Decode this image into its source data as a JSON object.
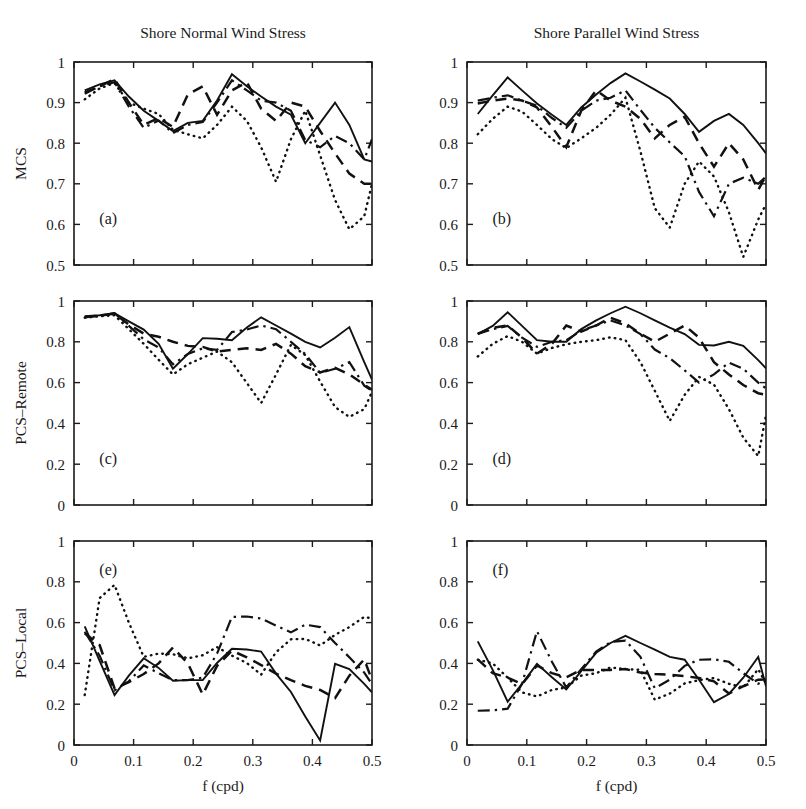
{
  "figure": {
    "width": 806,
    "height": 809,
    "background": "#ffffff",
    "ink_color": "#111111",
    "column_titles": [
      "Shore Normal Wind Stress",
      "Shore Parallel Wind Stress"
    ],
    "xlabel": "f (cpd)",
    "panel_tags": [
      "(a)",
      "(b)",
      "(c)",
      "(d)",
      "(e)",
      "(f)"
    ]
  },
  "axes": {
    "x": {
      "label": "f (cpd)",
      "lim": [
        0.0,
        0.5
      ],
      "ticks": [
        0.0,
        0.1,
        0.2,
        0.3,
        0.4,
        0.5
      ],
      "ticklabels": [
        "0",
        "0.1",
        "0.2",
        "0.3",
        "0.4",
        "0.5"
      ]
    },
    "y_top": {
      "label": "MCS",
      "lim": [
        0.5,
        1.0
      ],
      "ticks": [
        0.5,
        0.6,
        0.7,
        0.8,
        0.9,
        1.0
      ],
      "ticklabels": [
        "0.5",
        "0.6",
        "0.7",
        "0.8",
        "0.9",
        "1"
      ]
    },
    "y_mid": {
      "label": "PCS–Remote",
      "lim": [
        0.0,
        1.0
      ],
      "ticks": [
        0.0,
        0.2,
        0.4,
        0.6,
        0.8,
        1.0
      ],
      "ticklabels": [
        "0",
        "0.2",
        "0.4",
        "0.6",
        "0.8",
        "1"
      ]
    },
    "y_bot": {
      "label": "PCS–Local",
      "lim": [
        0.0,
        1.0
      ],
      "ticks": [
        0.0,
        0.2,
        0.4,
        0.6,
        0.8,
        1.0
      ],
      "ticklabels": [
        "0",
        "0.2",
        "0.4",
        "0.6",
        "0.8",
        "1"
      ]
    }
  },
  "linestyles": [
    "solid",
    "dashed",
    "dashdot",
    "dotted"
  ],
  "chart_data": [
    {
      "id": "panel-a",
      "tag": "(a)",
      "type": "line",
      "title": "Shore Normal Wind Stress",
      "xlabel": "f (cpd)",
      "ylabel": "MCS",
      "xlim": [
        0.0,
        0.5
      ],
      "ylim": [
        0.5,
        1.0
      ],
      "grid": false,
      "legend": "none",
      "x": [
        0.018,
        0.043,
        0.068,
        0.092,
        0.117,
        0.142,
        0.166,
        0.191,
        0.216,
        0.24,
        0.265,
        0.29,
        0.314,
        0.339,
        0.364,
        0.388,
        0.413,
        0.438,
        0.462,
        0.487,
        0.5
      ],
      "series": [
        {
          "name": "series-1",
          "linestyle": "solid",
          "values": [
            0.93,
            0.945,
            0.955,
            0.915,
            0.88,
            0.855,
            0.83,
            0.85,
            0.855,
            0.905,
            0.97,
            0.94,
            0.915,
            0.89,
            0.87,
            0.8,
            0.85,
            0.9,
            0.845,
            0.76,
            0.755
          ]
        },
        {
          "name": "series-2",
          "linestyle": "dashed",
          "values": [
            0.925,
            0.94,
            0.958,
            0.9,
            0.845,
            0.862,
            0.84,
            0.92,
            0.94,
            0.87,
            0.93,
            0.95,
            0.885,
            0.855,
            0.9,
            0.89,
            0.83,
            0.775,
            0.725,
            0.7,
            0.7
          ]
        },
        {
          "name": "series-3",
          "linestyle": "dashdot",
          "values": [
            0.922,
            0.94,
            0.95,
            0.89,
            0.838,
            0.856,
            0.825,
            0.845,
            0.852,
            0.9,
            0.955,
            0.93,
            0.905,
            0.9,
            0.88,
            0.808,
            0.79,
            0.818,
            0.8,
            0.76,
            0.81
          ]
        },
        {
          "name": "series-4",
          "linestyle": "dotted",
          "values": [
            0.908,
            0.935,
            0.948,
            0.9,
            0.885,
            0.872,
            0.833,
            0.822,
            0.812,
            0.845,
            0.89,
            0.855,
            0.79,
            0.705,
            0.81,
            0.88,
            0.77,
            0.66,
            0.588,
            0.62,
            0.7
          ]
        }
      ]
    },
    {
      "id": "panel-b",
      "tag": "(b)",
      "type": "line",
      "title": "Shore Parallel Wind Stress",
      "xlabel": "f (cpd)",
      "ylabel": "MCS",
      "xlim": [
        0.0,
        0.5
      ],
      "ylim": [
        0.5,
        1.0
      ],
      "grid": false,
      "legend": "none",
      "x": [
        0.018,
        0.043,
        0.068,
        0.092,
        0.117,
        0.142,
        0.166,
        0.191,
        0.216,
        0.24,
        0.265,
        0.29,
        0.314,
        0.339,
        0.364,
        0.388,
        0.413,
        0.438,
        0.462,
        0.487,
        0.5
      ],
      "series": [
        {
          "name": "series-1",
          "linestyle": "solid",
          "values": [
            0.872,
            0.918,
            0.962,
            0.93,
            0.898,
            0.87,
            0.845,
            0.888,
            0.92,
            0.948,
            0.972,
            0.952,
            0.932,
            0.91,
            0.872,
            0.828,
            0.855,
            0.872,
            0.845,
            0.8,
            0.775
          ]
        },
        {
          "name": "series-2",
          "linestyle": "dashed",
          "values": [
            0.898,
            0.905,
            0.91,
            0.905,
            0.888,
            0.84,
            0.79,
            0.88,
            0.93,
            0.905,
            0.89,
            0.86,
            0.812,
            0.845,
            0.865,
            0.8,
            0.742,
            0.8,
            0.76,
            0.685,
            0.72
          ]
        },
        {
          "name": "series-3",
          "linestyle": "dashdot",
          "values": [
            0.905,
            0.912,
            0.918,
            0.905,
            0.892,
            0.862,
            0.838,
            0.88,
            0.905,
            0.912,
            0.93,
            0.882,
            0.838,
            0.802,
            0.768,
            0.68,
            0.62,
            0.7,
            0.715,
            0.7,
            0.718
          ]
        },
        {
          "name": "series-4",
          "linestyle": "dotted",
          "values": [
            0.822,
            0.86,
            0.89,
            0.878,
            0.845,
            0.81,
            0.788,
            0.812,
            0.838,
            0.87,
            0.912,
            0.78,
            0.64,
            0.592,
            0.7,
            0.755,
            0.718,
            0.63,
            0.52,
            0.612,
            0.65
          ]
        }
      ]
    },
    {
      "id": "panel-c",
      "tag": "(c)",
      "type": "line",
      "title": "",
      "xlabel": "f (cpd)",
      "ylabel": "PCS–Remote",
      "xlim": [
        0.0,
        0.5
      ],
      "ylim": [
        0.0,
        1.0
      ],
      "grid": false,
      "legend": "none",
      "x": [
        0.018,
        0.043,
        0.068,
        0.092,
        0.117,
        0.142,
        0.166,
        0.191,
        0.216,
        0.24,
        0.265,
        0.29,
        0.314,
        0.339,
        0.364,
        0.388,
        0.413,
        0.438,
        0.462,
        0.487,
        0.5
      ],
      "series": [
        {
          "name": "series-1",
          "linestyle": "solid",
          "values": [
            0.925,
            0.93,
            0.94,
            0.9,
            0.86,
            0.79,
            0.668,
            0.74,
            0.818,
            0.815,
            0.808,
            0.87,
            0.92,
            0.88,
            0.84,
            0.8,
            0.772,
            0.82,
            0.872,
            0.7,
            0.615
          ]
        },
        {
          "name": "series-2",
          "linestyle": "dashed",
          "values": [
            0.922,
            0.928,
            0.938,
            0.885,
            0.84,
            0.825,
            0.8,
            0.78,
            0.775,
            0.752,
            0.76,
            0.768,
            0.76,
            0.79,
            0.742,
            0.68,
            0.65,
            0.672,
            0.64,
            0.59,
            0.565
          ]
        },
        {
          "name": "series-3",
          "linestyle": "dashdot",
          "values": [
            0.92,
            0.928,
            0.94,
            0.878,
            0.812,
            0.772,
            0.69,
            0.74,
            0.768,
            0.76,
            0.848,
            0.86,
            0.88,
            0.862,
            0.8,
            0.74,
            0.648,
            0.668,
            0.7,
            0.585,
            0.56
          ]
        },
        {
          "name": "series-4",
          "linestyle": "dotted",
          "values": [
            0.918,
            0.925,
            0.93,
            0.862,
            0.79,
            0.712,
            0.64,
            0.69,
            0.722,
            0.752,
            0.7,
            0.598,
            0.5,
            0.64,
            0.785,
            0.735,
            0.605,
            0.48,
            0.432,
            0.47,
            0.555
          ]
        }
      ]
    },
    {
      "id": "panel-d",
      "tag": "(d)",
      "type": "line",
      "title": "",
      "xlabel": "f (cpd)",
      "ylabel": "PCS–Remote",
      "xlim": [
        0.0,
        0.5
      ],
      "ylim": [
        0.0,
        1.0
      ],
      "grid": false,
      "legend": "none",
      "x": [
        0.018,
        0.043,
        0.068,
        0.092,
        0.117,
        0.142,
        0.166,
        0.191,
        0.216,
        0.24,
        0.265,
        0.29,
        0.314,
        0.339,
        0.364,
        0.388,
        0.413,
        0.438,
        0.462,
        0.487,
        0.5
      ],
      "series": [
        {
          "name": "series-1",
          "linestyle": "solid",
          "values": [
            0.838,
            0.878,
            0.945,
            0.878,
            0.808,
            0.8,
            0.8,
            0.862,
            0.905,
            0.94,
            0.972,
            0.94,
            0.905,
            0.87,
            0.838,
            0.785,
            0.782,
            0.8,
            0.78,
            0.71,
            0.67
          ]
        },
        {
          "name": "series-2",
          "linestyle": "dashed",
          "values": [
            0.84,
            0.868,
            0.88,
            0.82,
            0.742,
            0.79,
            0.88,
            0.85,
            0.88,
            0.918,
            0.89,
            0.84,
            0.8,
            0.84,
            0.88,
            0.82,
            0.7,
            0.64,
            0.588,
            0.548,
            0.54
          ]
        },
        {
          "name": "series-3",
          "linestyle": "dashdot",
          "values": [
            0.838,
            0.862,
            0.878,
            0.82,
            0.775,
            0.8,
            0.808,
            0.855,
            0.88,
            0.905,
            0.88,
            0.838,
            0.762,
            0.72,
            0.66,
            0.6,
            0.64,
            0.698,
            0.668,
            0.6,
            0.572
          ]
        },
        {
          "name": "series-4",
          "linestyle": "dotted",
          "values": [
            0.728,
            0.79,
            0.828,
            0.8,
            0.742,
            0.77,
            0.788,
            0.8,
            0.808,
            0.822,
            0.808,
            0.7,
            0.56,
            0.412,
            0.54,
            0.628,
            0.59,
            0.47,
            0.33,
            0.24,
            0.44
          ]
        }
      ]
    },
    {
      "id": "panel-e",
      "tag": "(e)",
      "type": "line",
      "title": "",
      "xlabel": "f (cpd)",
      "ylabel": "PCS–Local",
      "xlim": [
        0.0,
        0.5
      ],
      "ylim": [
        0.0,
        1.0
      ],
      "grid": false,
      "legend": "none",
      "x": [
        0.018,
        0.043,
        0.068,
        0.092,
        0.117,
        0.142,
        0.166,
        0.191,
        0.216,
        0.24,
        0.265,
        0.29,
        0.314,
        0.339,
        0.364,
        0.388,
        0.413,
        0.438,
        0.462,
        0.487,
        0.5
      ],
      "series": [
        {
          "name": "series-1",
          "linestyle": "solid",
          "values": [
            0.582,
            0.412,
            0.245,
            0.34,
            0.425,
            0.378,
            0.315,
            0.318,
            0.318,
            0.402,
            0.472,
            0.468,
            0.458,
            0.35,
            0.26,
            0.14,
            0.022,
            0.398,
            0.372,
            0.3,
            0.258
          ]
        },
        {
          "name": "series-2",
          "linestyle": "dashed",
          "values": [
            0.548,
            0.49,
            0.278,
            0.308,
            0.348,
            0.4,
            0.478,
            0.4,
            0.248,
            0.388,
            0.462,
            0.43,
            0.392,
            0.35,
            0.318,
            0.29,
            0.27,
            0.23,
            0.34,
            0.42,
            0.318
          ]
        },
        {
          "name": "series-3",
          "linestyle": "dashdot",
          "values": [
            0.555,
            0.438,
            0.268,
            0.312,
            0.39,
            0.352,
            0.318,
            0.318,
            0.33,
            0.448,
            0.628,
            0.63,
            0.62,
            0.585,
            0.552,
            0.59,
            0.578,
            0.5,
            0.43,
            0.355,
            0.298
          ]
        },
        {
          "name": "series-4",
          "linestyle": "dotted",
          "values": [
            0.245,
            0.72,
            0.785,
            0.6,
            0.432,
            0.448,
            0.445,
            0.425,
            0.44,
            0.48,
            0.438,
            0.402,
            0.345,
            0.455,
            0.518,
            0.52,
            0.488,
            0.54,
            0.578,
            0.628,
            0.62
          ]
        }
      ]
    },
    {
      "id": "panel-f",
      "tag": "(f)",
      "type": "line",
      "title": "",
      "xlabel": "f (cpd)",
      "ylabel": "PCS–Local",
      "xlim": [
        0.0,
        0.5
      ],
      "ylim": [
        0.0,
        1.0
      ],
      "grid": false,
      "legend": "none",
      "x": [
        0.018,
        0.043,
        0.068,
        0.092,
        0.117,
        0.142,
        0.166,
        0.191,
        0.216,
        0.24,
        0.265,
        0.29,
        0.314,
        0.339,
        0.364,
        0.388,
        0.413,
        0.438,
        0.462,
        0.487,
        0.5
      ],
      "series": [
        {
          "name": "series-1",
          "linestyle": "solid",
          "values": [
            0.508,
            0.368,
            0.212,
            0.3,
            0.398,
            0.332,
            0.272,
            0.362,
            0.452,
            0.5,
            0.535,
            0.5,
            0.468,
            0.432,
            0.418,
            0.32,
            0.21,
            0.25,
            0.33,
            0.432,
            0.288
          ]
        },
        {
          "name": "series-2",
          "linestyle": "dashed",
          "values": [
            0.42,
            0.352,
            0.33,
            0.298,
            0.39,
            0.352,
            0.332,
            0.368,
            0.368,
            0.368,
            0.372,
            0.355,
            0.348,
            0.345,
            0.338,
            0.328,
            0.312,
            0.252,
            0.288,
            0.32,
            0.322
          ]
        },
        {
          "name": "series-3",
          "linestyle": "dashdot",
          "values": [
            0.168,
            0.17,
            0.178,
            0.3,
            0.558,
            0.408,
            0.282,
            0.372,
            0.458,
            0.505,
            0.512,
            0.432,
            0.278,
            0.32,
            0.388,
            0.418,
            0.42,
            0.408,
            0.352,
            0.3,
            0.32
          ]
        },
        {
          "name": "series-4",
          "linestyle": "dotted",
          "values": [
            0.418,
            0.4,
            0.33,
            0.258,
            0.238,
            0.27,
            0.282,
            0.34,
            0.352,
            0.38,
            0.372,
            0.368,
            0.222,
            0.252,
            0.302,
            0.318,
            0.328,
            0.3,
            0.282,
            0.372,
            0.3
          ]
        }
      ]
    }
  ]
}
